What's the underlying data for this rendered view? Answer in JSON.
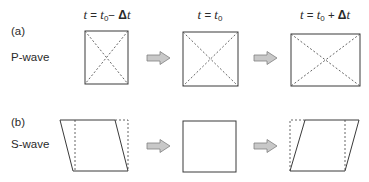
{
  "panels": [
    {
      "id": "a",
      "label": "(a)",
      "wave_name": "P-wave",
      "description": "Compressional wave: square element changes size (volume) without shear; diagonals shown dashed"
    },
    {
      "id": "b",
      "label": "(b)",
      "wave_name": "S-wave",
      "description": "Shear wave: square element sheared into parallelogram; original outline shown dashed"
    }
  ],
  "time_headers": [
    {
      "var": "t",
      "eq": "=",
      "base": "t",
      "sub": "0",
      "op": "−",
      "delta": "Δ",
      "dvar": "t",
      "full": "t = t0 − Δt"
    },
    {
      "var": "t",
      "eq": "=",
      "base": "t",
      "sub": "0",
      "op": "",
      "delta": "",
      "dvar": "",
      "full": "t = t0"
    },
    {
      "var": "t",
      "eq": "=",
      "base": "t",
      "sub": "0",
      "op": "+",
      "delta": "Δ",
      "dvar": "t",
      "full": "t = t0 + Δt"
    }
  ],
  "colors": {
    "line": "#3a3a3a",
    "dashed": "#555555",
    "arrow_fill": "#c8c8c8",
    "arrow_stroke": "#808080",
    "text": "#2a2a2a"
  },
  "arrows": [
    {
      "row": "a",
      "from": 1,
      "to": 2,
      "icon": "right-arrow-icon"
    },
    {
      "row": "a",
      "from": 2,
      "to": 3,
      "icon": "right-arrow-icon"
    },
    {
      "row": "b",
      "from": 1,
      "to": 2,
      "icon": "right-arrow-icon"
    },
    {
      "row": "b",
      "from": 2,
      "to": 3,
      "icon": "right-arrow-icon"
    }
  ]
}
